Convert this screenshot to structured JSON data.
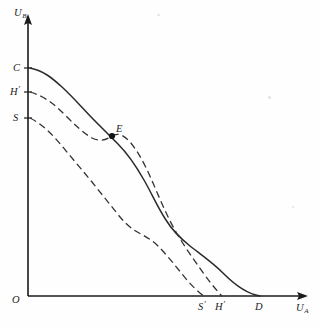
{
  "figure": {
    "title": "",
    "background_color": "#fefefe",
    "ink_color": "#1c1c1c"
  },
  "axes": {
    "y_label_base": "U",
    "y_label_sub": "B",
    "x_label_base": "U",
    "x_label_sub": "A",
    "origin_label": "O",
    "y_axis_x_px": 28,
    "x_axis_y_px": 296
  },
  "y_intercepts": [
    {
      "name": "c-label",
      "base": "C",
      "prime": "",
      "y_px": 68
    },
    {
      "name": "h-prime-label",
      "base": "H",
      "prime": "′",
      "y_px": 92
    },
    {
      "name": "s-label",
      "base": "S",
      "prime": "",
      "y_px": 118
    }
  ],
  "x_intercepts": [
    {
      "name": "s-prime-label",
      "base": "S",
      "prime": "′",
      "x_px": 204
    },
    {
      "name": "h-prime-axis-label",
      "base": "H",
      "prime": "′",
      "x_px": 222
    },
    {
      "name": "d-label",
      "base": "D",
      "prime": "",
      "x_px": 260
    }
  ],
  "points": [
    {
      "name": "point-e",
      "label": "E",
      "x_px": 112,
      "y_px": 135
    }
  ],
  "chart_data": {
    "type": "line",
    "title": "",
    "xlabel": "U_A",
    "ylabel": "U_B",
    "grid": false,
    "legend": false,
    "xlim": [
      0,
      320
    ],
    "ylim": [
      0,
      329
    ],
    "annotations": [
      {
        "text": "C",
        "at": "y-intercept of solid curve"
      },
      {
        "text": "H′",
        "at": "y-intercept of middle dashed curve"
      },
      {
        "text": "S",
        "at": "y-intercept of lower dashed curve"
      },
      {
        "text": "E",
        "at": "intersection of solid and middle dashed curves"
      },
      {
        "text": "S′",
        "at": "x-intercept of lower dashed curve"
      },
      {
        "text": "H′",
        "at": "x-intercept of middle dashed curve"
      },
      {
        "text": "D",
        "at": "x-intercept of solid curve"
      },
      {
        "text": "O",
        "at": "origin"
      }
    ],
    "series": [
      {
        "name": "CD-curve",
        "style": "solid",
        "from_label": "C",
        "to_label": "D",
        "path": "M 30 68 C 44 71 52 78 62 87 C 74 98 84 110 96 122 C 104 130 110 136 118 144 C 128 154 136 166 144 180 C 152 194 158 208 166 220 C 172 230 180 238 190 246 C 200 254 212 262 224 274 C 236 286 248 294 260 296"
      },
      {
        "name": "H-prime-curve",
        "style": "dashed",
        "from_label": "H′",
        "to_label": "H′",
        "path": "M 30 92 C 44 96 54 104 64 114 C 74 124 82 132 92 138 C 100 142 106 140 112 136 C 120 131 128 138 136 150 C 144 162 150 176 156 190 C 162 204 168 218 176 232 C 184 246 194 260 204 274 C 212 285 218 292 222 296"
      },
      {
        "name": "S-curve",
        "style": "dashed",
        "from_label": "S",
        "to_label": "S′",
        "path": "M 30 118 C 42 124 52 134 62 146 C 72 158 82 170 92 182 C 100 192 108 202 116 212 C 122 220 128 226 134 230 C 142 235 150 238 158 246 C 166 254 174 264 182 274 C 190 284 198 292 204 296"
      }
    ]
  }
}
